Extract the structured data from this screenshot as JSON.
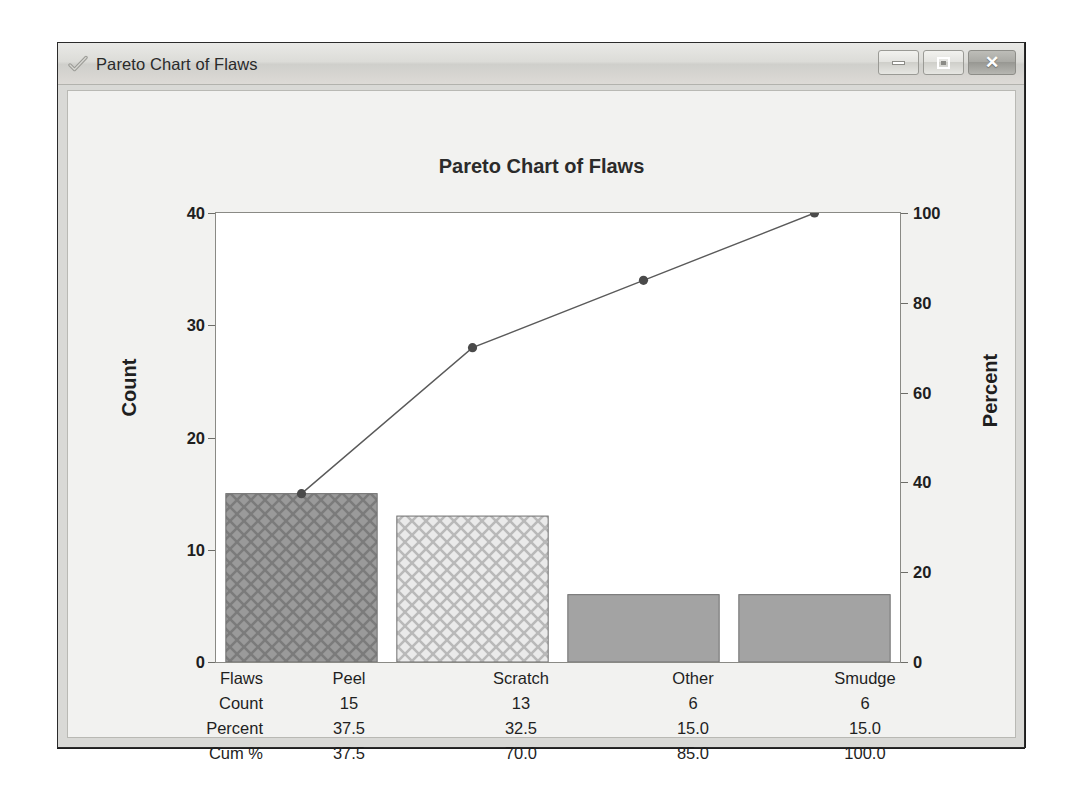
{
  "window": {
    "title": "Pareto Chart of Flaws",
    "icon": "checkmark-icon",
    "buttons": {
      "minimize": "minimize-icon",
      "maximize": "maximize-icon",
      "close": "✕"
    }
  },
  "chart_data": {
    "type": "bar",
    "title": "Pareto Chart of Flaws",
    "xlabel": "",
    "ylabel": "Count",
    "y2label": "Percent",
    "categories": [
      "Peel",
      "Scratch",
      "Other",
      "Smudge"
    ],
    "values": [
      15,
      13,
      6,
      6
    ],
    "ylim": [
      0,
      40
    ],
    "yticks": [
      "0",
      "10",
      "20",
      "30",
      "40"
    ],
    "y2lim": [
      0,
      100
    ],
    "y2ticks": [
      "0",
      "20",
      "40",
      "60",
      "80",
      "100"
    ],
    "cumulative_percent": [
      37.5,
      70.0,
      85.0,
      100.0
    ],
    "percent": [
      37.5,
      32.5,
      15.0,
      15.0
    ],
    "grid": false,
    "legend": "none",
    "series": [
      {
        "name": "Count",
        "values": [
          15,
          13,
          6,
          6
        ]
      },
      {
        "name": "Cum %",
        "values": [
          37.5,
          70.0,
          85.0,
          100.0
        ]
      }
    ],
    "bar_fills": [
      "crosshatch-dark",
      "crosshatch-light",
      "solid-gray",
      "solid-gray"
    ],
    "colors": {
      "bar_dark": "#8d8d8d",
      "bar_light": "#d8d8d8",
      "bar_solid": "#a3a3a3",
      "line": "#5a5a5a",
      "marker": "#4a4a4a",
      "text": "#1f1f1f",
      "plot_bg": "#ffffff",
      "panel_bg": "#f2f2f0"
    }
  },
  "table": {
    "rows": [
      {
        "label": "Flaws",
        "cells": [
          "Peel",
          "Scratch",
          "Other",
          "Smudge"
        ]
      },
      {
        "label": "Count",
        "cells": [
          "15",
          "13",
          "6",
          "6"
        ]
      },
      {
        "label": "Percent",
        "cells": [
          "37.5",
          "32.5",
          "15.0",
          "15.0"
        ]
      },
      {
        "label": "Cum %",
        "cells": [
          "37.5",
          "70.0",
          "85.0",
          "100.0"
        ]
      }
    ]
  }
}
